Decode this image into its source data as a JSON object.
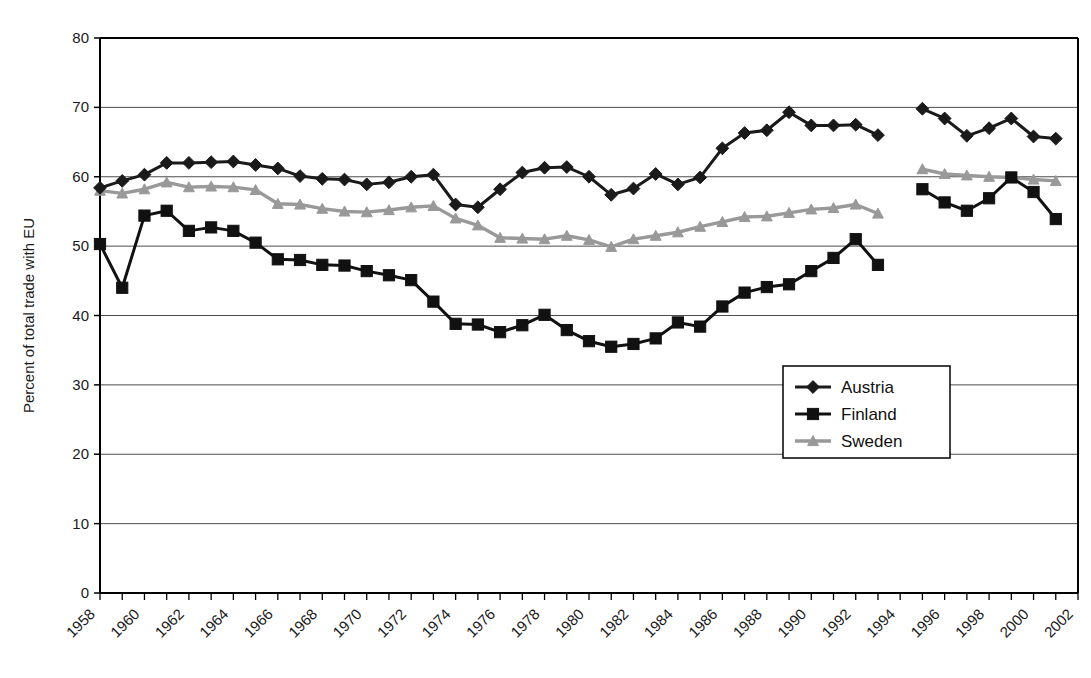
{
  "chart_data": {
    "type": "line",
    "title": "",
    "xlabel": "",
    "ylabel": "Percent of total trade with EU",
    "xlim": [
      1958,
      2002
    ],
    "ylim": [
      0,
      80
    ],
    "ytick_values": [
      0,
      10,
      20,
      30,
      40,
      50,
      60,
      70,
      80
    ],
    "ytick_labels": [
      "0",
      "10",
      "20",
      "30",
      "40",
      "50",
      "60",
      "70",
      "80"
    ],
    "xtick_values": [
      1958,
      1960,
      1962,
      1964,
      1966,
      1968,
      1970,
      1972,
      1974,
      1976,
      1978,
      1980,
      1982,
      1984,
      1986,
      1988,
      1990,
      1992,
      1994,
      1996,
      1998,
      2000,
      2002
    ],
    "xtick_labels": [
      "1958",
      "1960",
      "1962",
      "1964",
      "1966",
      "1968",
      "1970",
      "1972",
      "1974",
      "1976",
      "1978",
      "1980",
      "1982",
      "1984",
      "1986",
      "1988",
      "1990",
      "1992",
      "1994",
      "1996",
      "1998",
      "2000",
      "2002"
    ],
    "grid": "horizontal",
    "legend_position": "inside-lower-right",
    "series": [
      {
        "name": "Austria",
        "color": "#1a1a1a",
        "marker": "diamond",
        "segments": [
          {
            "x": [
              1958,
              1959,
              1960,
              1961,
              1962,
              1963,
              1964,
              1965,
              1966,
              1967,
              1968,
              1969,
              1970,
              1971,
              1972,
              1973,
              1974,
              1975,
              1976,
              1977,
              1978,
              1979,
              1980,
              1981,
              1982,
              1983,
              1984,
              1985,
              1986,
              1987,
              1988,
              1989,
              1990,
              1991,
              1992,
              1993
            ],
            "y": [
              58.4,
              59.4,
              60.3,
              62.0,
              62.0,
              62.1,
              62.2,
              61.7,
              61.2,
              60.1,
              59.7,
              59.6,
              58.9,
              59.2,
              60.0,
              60.3,
              56.0,
              55.6,
              58.2,
              60.6,
              61.3,
              61.4,
              60.0,
              57.4,
              58.3,
              60.4,
              58.9,
              59.9,
              64.1,
              66.3,
              66.7,
              69.3,
              67.4,
              67.4,
              67.5,
              66.0
            ]
          },
          {
            "x": [
              1995,
              1996,
              1997,
              1998,
              1999,
              2000,
              2001
            ],
            "y": [
              69.8,
              68.4,
              65.9,
              67.0,
              68.4,
              65.8,
              65.5
            ]
          }
        ]
      },
      {
        "name": "Finland",
        "color": "#111111",
        "marker": "square",
        "segments": [
          {
            "x": [
              1958,
              1959,
              1960,
              1961,
              1962,
              1963,
              1964,
              1965,
              1966,
              1967,
              1968,
              1969,
              1970,
              1971,
              1972,
              1973,
              1974,
              1975,
              1976,
              1977,
              1978,
              1979,
              1980,
              1981,
              1982,
              1983,
              1984,
              1985,
              1986,
              1987,
              1988,
              1989,
              1990,
              1991,
              1992,
              1993
            ],
            "y": [
              50.3,
              44.0,
              54.4,
              55.1,
              52.2,
              52.7,
              52.2,
              50.5,
              48.1,
              48.0,
              47.3,
              47.2,
              46.4,
              45.8,
              45.1,
              42.0,
              38.8,
              38.7,
              37.6,
              38.6,
              40.1,
              37.9,
              36.3,
              35.5,
              35.9,
              36.7,
              39.0,
              38.4,
              41.3,
              43.3,
              44.1,
              44.5,
              46.4,
              48.3,
              51.0,
              47.3
            ]
          },
          {
            "x": [
              1995,
              1996,
              1997,
              1998,
              1999,
              2000,
              2001
            ],
            "y": [
              58.2,
              56.3,
              55.1,
              56.9,
              59.9,
              57.8,
              53.9
            ]
          }
        ]
      },
      {
        "name": "Sweden",
        "color": "#999999",
        "marker": "triangle",
        "segments": [
          {
            "x": [
              1958,
              1959,
              1960,
              1961,
              1962,
              1963,
              1964,
              1965,
              1966,
              1967,
              1968,
              1969,
              1970,
              1971,
              1972,
              1973,
              1974,
              1975,
              1976,
              1977,
              1978,
              1979,
              1980,
              1981,
              1982,
              1983,
              1984,
              1985,
              1986,
              1987,
              1988,
              1989,
              1990,
              1991,
              1992,
              1993
            ],
            "y": [
              58.0,
              57.6,
              58.2,
              59.2,
              58.5,
              58.6,
              58.5,
              58.1,
              56.1,
              56.0,
              55.4,
              55.0,
              54.9,
              55.2,
              55.6,
              55.8,
              54.0,
              53.0,
              51.2,
              51.1,
              51.0,
              51.5,
              50.9,
              49.9,
              51.0,
              51.5,
              52.0,
              52.8,
              53.5,
              54.2,
              54.3,
              54.8,
              55.3,
              55.5,
              56.0,
              54.7
            ]
          },
          {
            "x": [
              1995,
              1996,
              1997,
              1998,
              1999,
              2000,
              2001
            ],
            "y": [
              61.1,
              60.4,
              60.2,
              60.0,
              59.9,
              59.6,
              59.4
            ]
          }
        ]
      }
    ]
  },
  "legend": {
    "items": [
      {
        "label": "Austria"
      },
      {
        "label": "Finland"
      },
      {
        "label": "Sweden"
      }
    ]
  }
}
